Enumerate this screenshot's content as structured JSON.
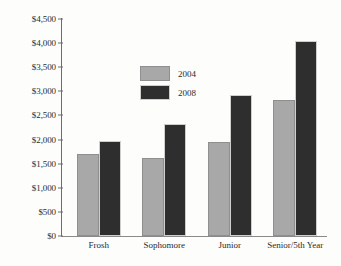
{
  "chart_data": {
    "type": "bar",
    "title": "",
    "subtitle": "",
    "xlabel": "",
    "ylabel": "",
    "categories": [
      "Frosh",
      "Sophomore",
      "Junior",
      "Senior/5th Year"
    ],
    "series": [
      {
        "name": "2004",
        "color": "#a8a8a8",
        "values": [
          1710,
          1620,
          1960,
          2830
        ]
      },
      {
        "name": "2008",
        "color": "#2e2e2e",
        "values": [
          1980,
          2320,
          2920,
          4050
        ]
      }
    ],
    "ylim": [
      0,
      4500
    ],
    "ytick_values": [
      0,
      500,
      1000,
      1500,
      2000,
      2500,
      3000,
      3500,
      4000,
      4500
    ],
    "ytick_labels": [
      "$0",
      "$500",
      "$1,000",
      "$1,500",
      "$2,000",
      "$2,500",
      "$3,000",
      "$3,500",
      "$4,000",
      "$4,500"
    ],
    "grid": false,
    "legend_position": "upper-left",
    "annotations": []
  },
  "legend": {
    "items": [
      {
        "label": "2004"
      },
      {
        "label": "2008"
      }
    ]
  }
}
